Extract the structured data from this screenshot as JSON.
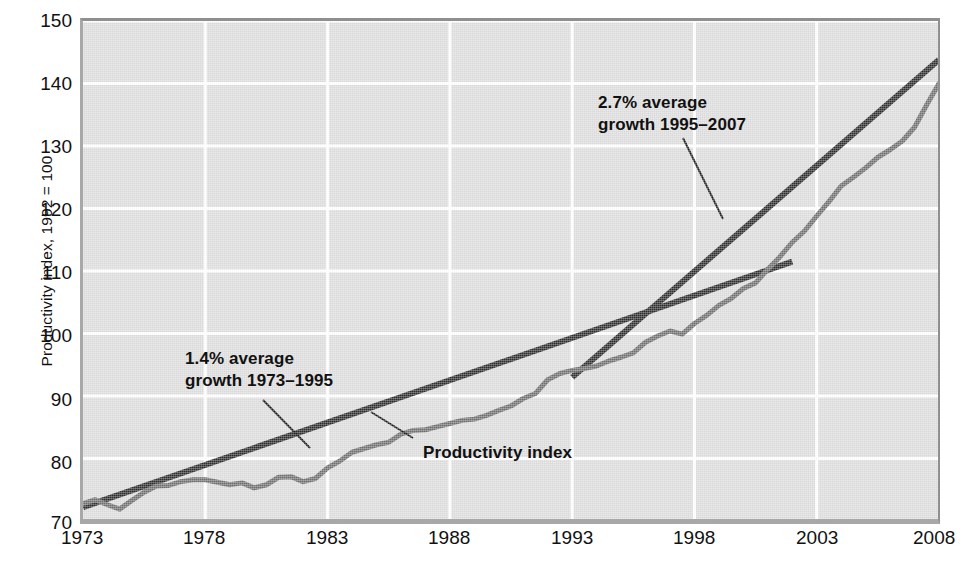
{
  "chart_data": {
    "type": "line",
    "title": "",
    "xlabel": "",
    "ylabel": "Productivity index, 1992 = 100",
    "xlim": [
      1973,
      2008
    ],
    "ylim": [
      70,
      150
    ],
    "ytick_values": [
      70,
      80,
      90,
      100,
      110,
      120,
      130,
      140,
      150
    ],
    "xtick_values": [
      1973,
      1978,
      1983,
      1988,
      1993,
      1998,
      2003,
      2008
    ],
    "ytick_labels": [
      "70",
      "80",
      "90",
      "100",
      "110",
      "120",
      "130",
      "140",
      "150"
    ],
    "xtick_labels": [
      "1973",
      "1978",
      "1983",
      "1988",
      "1993",
      "1998",
      "2003",
      "2008"
    ],
    "grid": true,
    "legend": "none",
    "series": [
      {
        "name": "Productivity index",
        "color": "#6f6f6f",
        "x": [
          1973.0,
          1973.5,
          1974.0,
          1974.5,
          1975.0,
          1975.5,
          1976.0,
          1976.5,
          1977.0,
          1977.5,
          1978.0,
          1978.5,
          1979.0,
          1979.5,
          1980.0,
          1980.5,
          1981.0,
          1981.5,
          1982.0,
          1982.5,
          1983.0,
          1983.5,
          1984.0,
          1984.5,
          1985.0,
          1985.5,
          1986.0,
          1986.5,
          1987.0,
          1987.5,
          1988.0,
          1988.5,
          1989.0,
          1989.5,
          1990.0,
          1990.5,
          1991.0,
          1991.5,
          1992.0,
          1992.5,
          1993.0,
          1993.5,
          1994.0,
          1994.5,
          1995.0,
          1995.5,
          1996.0,
          1996.5,
          1997.0,
          1997.5,
          1998.0,
          1998.5,
          1999.0,
          1999.5,
          2000.0,
          2000.5,
          2001.0,
          2001.5,
          2002.0,
          2002.5,
          2003.0,
          2003.5,
          2004.0,
          2004.5,
          2005.0,
          2005.5,
          2006.0,
          2006.5,
          2007.0,
          2007.5,
          2008.0
        ],
        "y": [
          72.8,
          73.4,
          72.6,
          71.9,
          73.3,
          74.6,
          75.6,
          75.7,
          76.3,
          76.6,
          76.6,
          76.2,
          75.8,
          76.1,
          75.3,
          75.8,
          77.0,
          77.1,
          76.3,
          76.8,
          78.5,
          79.6,
          81.0,
          81.6,
          82.2,
          82.6,
          83.9,
          84.5,
          84.6,
          85.1,
          85.6,
          86.1,
          86.3,
          86.9,
          87.7,
          88.4,
          89.6,
          90.4,
          92.6,
          93.6,
          94.1,
          94.4,
          94.8,
          95.6,
          96.2,
          96.9,
          98.6,
          99.6,
          100.4,
          99.9,
          101.6,
          102.9,
          104.5,
          105.6,
          107.2,
          108.1,
          110.3,
          112.3,
          114.6,
          116.4,
          118.8,
          121.1,
          123.6,
          125.0,
          126.5,
          128.2,
          129.4,
          130.8,
          133.0,
          136.6,
          140.0
        ]
      }
    ],
    "trend_lines": [
      {
        "name": "1.4% average growth 1973-1995",
        "label": "1.4% average\ngrowth 1973–1995",
        "rate_percent": 1.4,
        "period": "1973–1995",
        "x_start": 1973.0,
        "y_start": 72.2,
        "x_end": 2002.0,
        "y_end": 111.5,
        "color": "#2d2d2d"
      },
      {
        "name": "2.7% average growth 1995-2007",
        "label": "2.7% average\ngrowth 1995–2007",
        "rate_percent": 2.7,
        "period": "1995–2007",
        "x_start": 1993.0,
        "y_start": 93.0,
        "x_end": 2008.0,
        "y_end": 143.8,
        "color": "#2d2d2d"
      }
    ],
    "annotations": [
      {
        "id": "annot-27",
        "line1": "2.7% average",
        "line2": "growth 1995–2007"
      },
      {
        "id": "annot-14",
        "line1": "1.4% average",
        "line2": "growth 1973–1995"
      },
      {
        "id": "annot-series",
        "line1": "Productivity index",
        "line2": ""
      }
    ]
  },
  "axis": {
    "y_title": "Productivity index, 1992 = 100",
    "y_ticks": [
      "150",
      "140",
      "130",
      "120",
      "110",
      "100",
      "90",
      "80",
      "70"
    ],
    "x_ticks": [
      "1973",
      "1978",
      "1983",
      "1988",
      "1993",
      "1998",
      "2003",
      "2008"
    ]
  },
  "annotations": {
    "growth_27_line1": "2.7% average",
    "growth_27_line2": "growth 1995–2007",
    "growth_14_line1": "1.4% average",
    "growth_14_line2": "growth 1973–1995",
    "series_label": "Productivity index"
  },
  "colors": {
    "plot_background": "#dddddd",
    "gridline": "#ffffff",
    "series_line": "#6f6f6f",
    "trend_line": "#2d2d2d",
    "text": "#111111",
    "frame": "#8f8f8f"
  }
}
